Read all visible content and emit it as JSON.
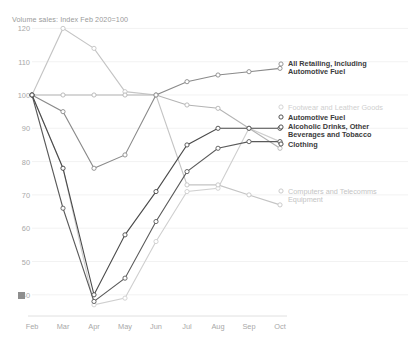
{
  "chart_data": {
    "type": "line",
    "title": "Volume sales: Index Feb 2020=100",
    "xlabel": "",
    "ylabel": "",
    "x": [
      "Feb",
      "Mar",
      "Apr",
      "May",
      "Jun",
      "Jul",
      "Aug",
      "Sep",
      "Oct"
    ],
    "categories": [
      "Feb",
      "Mar",
      "Apr",
      "May",
      "Jun",
      "Jul",
      "Aug",
      "Sep",
      "Oct"
    ],
    "ylim": [
      35,
      122
    ],
    "yticks": [
      120,
      110,
      100,
      90,
      80,
      70,
      60,
      50,
      40
    ],
    "grid": true,
    "legend_position": "right",
    "series": [
      {
        "name": "All Retailing, Including Automotive Fuel",
        "color": "#8a8a8a",
        "bold_label": true,
        "values": [
          100,
          95,
          78,
          82,
          100,
          104,
          106,
          107,
          108
        ]
      },
      {
        "name": "Footwear and Leather Goods",
        "color": "#cfcfcf",
        "bold_label": false,
        "values": [
          100,
          78,
          37,
          39,
          56,
          71,
          72,
          90,
          86
        ]
      },
      {
        "name": "Automotive Fuel",
        "color": "#4a4a4a",
        "bold_label": true,
        "values": [
          100,
          78,
          40,
          58,
          71,
          85,
          90,
          90,
          90
        ]
      },
      {
        "name": "Alcoholic Drinks, Other Beverages and Tobacco",
        "color": "#b4b4b4",
        "bold_label": false,
        "values": [
          100,
          100,
          100,
          100,
          100,
          97,
          96,
          90,
          84
        ]
      },
      {
        "name": "Clothing",
        "color": "#5a5a5a",
        "bold_label": true,
        "values": [
          100,
          66,
          38,
          45,
          62,
          77,
          84,
          86,
          86
        ]
      },
      {
        "name": "Computers and Telecomms Equipment",
        "color": "#c4c4c4",
        "bold_label": false,
        "values": [
          100,
          120,
          114,
          101,
          100,
          73,
          73,
          70,
          67
        ]
      }
    ],
    "legend_entries": [
      {
        "label": "All Retailing, Including\nAutomotive Fuel",
        "bold": true,
        "color": "#8a8a8a",
        "x": 288,
        "y": 60,
        "marker_x": 281,
        "marker_y": 64
      },
      {
        "label": "Footwear and Leather Goods",
        "bold": false,
        "color": "#cfcfcf",
        "x": 288,
        "y": 104,
        "marker_x": 281,
        "marker_y": 107
      },
      {
        "label": "Automotive Fuel",
        "bold": true,
        "color": "#3f3f3f",
        "x": 288,
        "y": 114,
        "marker_x": 281,
        "marker_y": 117
      },
      {
        "label": "Alcoholic Drinks, Other\nBeverages and Tobacco",
        "bold": true,
        "color": "#3f3f3f",
        "x": 288,
        "y": 123,
        "marker_x": 281,
        "marker_y": 127
      },
      {
        "label": "Clothing",
        "bold": true,
        "color": "#3f3f3f",
        "x": 288,
        "y": 141,
        "marker_x": 281,
        "marker_y": 144
      },
      {
        "label": "Computers and Telecomms\nEquipment",
        "bold": false,
        "color": "#c4c4c4",
        "x": 288,
        "y": 188,
        "marker_x": 281,
        "marker_y": 191
      }
    ]
  },
  "axis": {
    "yticks": [
      "120",
      "110",
      "100",
      "90",
      "80",
      "70",
      "60",
      "50",
      "40"
    ],
    "xticks": [
      "Feb",
      "Mar",
      "Apr",
      "May",
      "Jun",
      "Jul",
      "Aug",
      "Sep",
      "Oct"
    ]
  }
}
